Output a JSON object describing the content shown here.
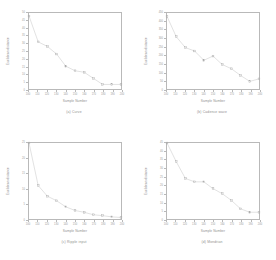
{
  "figure": {
    "title": "",
    "background_color": "#ffffff",
    "line_color": "#c3c3c3",
    "marker_color": "#a8a8a8",
    "axis_color": "#b9b9b9",
    "text_color": "#8f8f8f",
    "layout": "2x2 grid of line plots"
  },
  "chart_data": [
    {
      "type": "line",
      "panel": "a",
      "title": "(a) Curve",
      "xlabel": "Sample Number",
      "ylabel": "Euclidean distance",
      "xlim": [
        100,
        200
      ],
      "ylim": [
        0,
        50
      ],
      "xticks": [
        100,
        110,
        120,
        130,
        140,
        150,
        160,
        170,
        180,
        190,
        200
      ],
      "yticks": [
        0,
        5,
        10,
        15,
        20,
        25,
        30,
        35,
        40,
        45,
        50
      ],
      "grid": false,
      "legend": "none",
      "x": [
        100,
        110,
        120,
        130,
        140,
        150,
        160,
        170,
        180,
        190,
        200
      ],
      "values": [
        48,
        31,
        28,
        23,
        15,
        12,
        11,
        7,
        3,
        3,
        3
      ]
    },
    {
      "type": "line",
      "panel": "b",
      "title": "(b) Cadence wave",
      "xlabel": "Sample Number",
      "ylabel": "Euclidean distance",
      "xlim": [
        100,
        200
      ],
      "ylim": [
        0,
        450
      ],
      "xticks": [
        100,
        110,
        120,
        130,
        140,
        150,
        160,
        170,
        180,
        190,
        200
      ],
      "yticks": [
        0,
        50,
        100,
        150,
        200,
        250,
        300,
        350,
        400,
        450
      ],
      "grid": false,
      "legend": "none",
      "x": [
        100,
        110,
        120,
        130,
        140,
        150,
        160,
        170,
        180,
        190,
        200
      ],
      "values": [
        430,
        310,
        245,
        225,
        170,
        195,
        145,
        120,
        80,
        45,
        60
      ]
    },
    {
      "type": "line",
      "panel": "c",
      "title": "(c) Ripple input",
      "xlabel": "Sample Number",
      "ylabel": "Euclidean distance",
      "xlim": [
        100,
        200
      ],
      "ylim": [
        0,
        25
      ],
      "xticks": [
        100,
        110,
        120,
        130,
        140,
        150,
        160,
        170,
        180,
        190,
        200
      ],
      "yticks": [
        0,
        5,
        10,
        15,
        20,
        25
      ],
      "grid": false,
      "legend": "none",
      "x": [
        100,
        110,
        120,
        130,
        140,
        150,
        160,
        170,
        180,
        190,
        200
      ],
      "values": [
        25,
        11,
        7.5,
        6,
        4,
        2.8,
        2.2,
        1.4,
        1.1,
        0.7,
        0.5
      ]
    },
    {
      "type": "line",
      "panel": "d",
      "title": "(d) Mondrian",
      "xlabel": "Sample Number",
      "ylabel": "Euclidean distance",
      "xlim": [
        100,
        200
      ],
      "ylim": [
        0,
        45
      ],
      "xticks": [
        100,
        110,
        120,
        130,
        140,
        150,
        160,
        170,
        180,
        190,
        200
      ],
      "yticks": [
        0,
        5,
        10,
        15,
        20,
        25,
        30,
        35,
        40,
        45
      ],
      "grid": false,
      "legend": "none",
      "x": [
        100,
        110,
        120,
        130,
        140,
        150,
        160,
        170,
        180,
        190,
        200
      ],
      "values": [
        45,
        34,
        24,
        22,
        22,
        18,
        15,
        11,
        6,
        4,
        4
      ]
    }
  ]
}
